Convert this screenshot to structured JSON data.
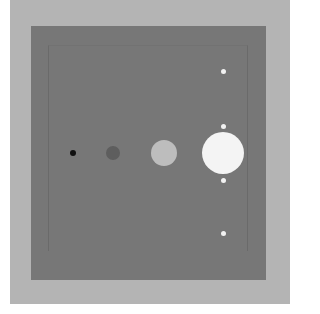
{
  "scene": {
    "background_color": "#b4b4b4",
    "square_color": "#777777",
    "frame_color": "#6a6a6a"
  },
  "circles": [
    {
      "name": "smallest-black-circle",
      "cx": 73,
      "cy": 153,
      "r": 3,
      "color": "#111111"
    },
    {
      "name": "small-gray-circle",
      "cx": 113,
      "cy": 153,
      "r": 7,
      "color": "#5e5e5e"
    },
    {
      "name": "medium-light-circle",
      "cx": 164,
      "cy": 153,
      "r": 13,
      "color": "#bdbdbd"
    },
    {
      "name": "large-white-circle",
      "cx": 223,
      "cy": 153,
      "r": 21,
      "color": "#f4f4f4"
    }
  ],
  "satellites": [
    {
      "name": "satellite-top",
      "cx": 223,
      "cy": 71,
      "r": 2.5,
      "color": "#f2f2f2"
    },
    {
      "name": "satellite-upper",
      "cx": 223,
      "cy": 126,
      "r": 2.5,
      "color": "#f2f2f2"
    },
    {
      "name": "satellite-lower",
      "cx": 223,
      "cy": 180,
      "r": 2.5,
      "color": "#f2f2f2"
    },
    {
      "name": "satellite-bottom",
      "cx": 223,
      "cy": 233,
      "r": 2.5,
      "color": "#f2f2f2"
    }
  ]
}
